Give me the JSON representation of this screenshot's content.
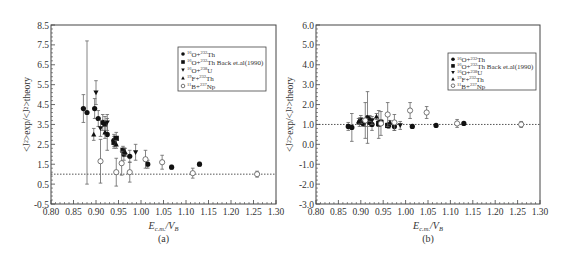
{
  "chart_data": [
    {
      "type": "scatter",
      "panel_label": "(a)",
      "xlabel": "E_c.m./V_B",
      "ylabel": "<J²>exp/<J²>theory",
      "xlim": [
        0.8,
        1.3
      ],
      "ylim": [
        -0.5,
        8.5
      ],
      "xticks": [
        "0.80",
        "0.85",
        "0.90",
        "0.95",
        "1.00",
        "1.05",
        "1.10",
        "1.15",
        "1.20",
        "1.25",
        "1.30"
      ],
      "yticks": [
        "-0.5",
        "0.5",
        "1.5",
        "2.5",
        "3.5",
        "4.5",
        "5.5",
        "6.5",
        "7.5",
        "8.5"
      ],
      "reference_line": 1.0,
      "legend_position": "upper right",
      "series": [
        {
          "name": "16O+232Th",
          "marker": "filled-circle",
          "x": [
            0.872,
            0.88,
            0.897,
            0.905,
            0.915,
            0.92,
            0.925,
            0.94,
            0.962,
            0.975,
            1.015,
            1.068,
            1.13
          ],
          "y": [
            4.3,
            4.1,
            4.3,
            3.8,
            3.6,
            3.5,
            3.0,
            2.7,
            2.0,
            1.9,
            1.5,
            1.35,
            1.5
          ],
          "err": [
            0.7,
            3.6,
            0.5,
            0.4,
            0.4,
            0.4,
            0.8,
            0.3,
            0.3,
            0.3,
            0.2,
            0.1,
            0.1
          ]
        },
        {
          "name": "16O+232Th Back et.al(1990)",
          "marker": "filled-square",
          "x": [
            0.94,
            0.945,
            0.96
          ],
          "y": [
            2.6,
            2.8,
            2.2
          ],
          "err": [
            0.3,
            0.3,
            0.2
          ]
        },
        {
          "name": "16O+238U",
          "marker": "filled-down-triangle",
          "x": [
            0.9,
            0.91,
            0.925,
            0.988
          ],
          "y": [
            5.1,
            3.3,
            3.6,
            2.1
          ],
          "err": [
            0.6,
            0.4,
            0.4,
            0.4
          ]
        },
        {
          "name": "19F+232Th",
          "marker": "filled-up-triangle",
          "x": [
            0.895,
            0.92,
            0.945,
            0.965
          ],
          "y": [
            3.0,
            3.1,
            2.5,
            2.1
          ],
          "err": [
            0.3,
            0.3,
            0.2,
            0.2
          ]
        },
        {
          "name": "11B+237Np",
          "marker": "open-circle",
          "x": [
            0.91,
            0.945,
            0.957,
            0.975,
            1.01,
            1.047,
            1.115,
            1.258
          ],
          "y": [
            1.65,
            1.1,
            1.55,
            1.1,
            1.75,
            1.6,
            1.05,
            1.0
          ],
          "err": [
            1.1,
            0.7,
            0.6,
            0.5,
            0.45,
            0.35,
            0.25,
            0.15
          ]
        }
      ]
    },
    {
      "type": "scatter",
      "panel_label": "(b)",
      "xlabel": "E_c.m./V_B",
      "ylabel": "<J²>exp/<J²>theory",
      "xlim": [
        0.8,
        1.3
      ],
      "ylim": [
        -3.0,
        6.0
      ],
      "xticks": [
        "0.80",
        "0.85",
        "0.90",
        "0.95",
        "1.00",
        "1.05",
        "1.10",
        "1.15",
        "1.20",
        "1.25",
        "1.30"
      ],
      "yticks": [
        "-3.0",
        "-2.0",
        "-1.0",
        "0.0",
        "1.0",
        "2.0",
        "3.0",
        "4.0",
        "5.0",
        "6.0"
      ],
      "reference_line": 1.0,
      "legend_position": "upper right",
      "series": [
        {
          "name": "16O+232Th",
          "marker": "filled-circle",
          "x": [
            0.872,
            0.88,
            0.897,
            0.905,
            0.915,
            0.92,
            0.925,
            0.94,
            0.962,
            0.975,
            1.015,
            1.068,
            1.13
          ],
          "y": [
            0.9,
            0.85,
            1.1,
            1.05,
            1.35,
            1.1,
            1.0,
            1.0,
            0.95,
            0.9,
            0.9,
            0.95,
            1.05
          ],
          "err": [
            0.2,
            0.7,
            0.2,
            0.15,
            1.3,
            0.2,
            0.3,
            0.7,
            0.15,
            0.2,
            0.1,
            0.05,
            0.05
          ]
        },
        {
          "name": "16O+232Th Back et.al(1990)",
          "marker": "filled-square",
          "x": [
            0.94,
            0.945,
            0.96
          ],
          "y": [
            1.05,
            1.1,
            0.95
          ],
          "err": [
            0.15,
            0.15,
            0.1
          ]
        },
        {
          "name": "16O+238U",
          "marker": "filled-down-triangle",
          "x": [
            0.9,
            0.91,
            0.925,
            0.988
          ],
          "y": [
            1.25,
            1.1,
            1.2,
            0.95
          ],
          "err": [
            0.2,
            0.2,
            0.2,
            0.2
          ]
        },
        {
          "name": "19F+232Th",
          "marker": "filled-up-triangle",
          "x": [
            0.895,
            0.92,
            0.935,
            0.965
          ],
          "y": [
            1.15,
            1.3,
            1.4,
            1.1
          ],
          "err": [
            0.15,
            0.15,
            0.15,
            0.1
          ]
        },
        {
          "name": "11B+237Np",
          "marker": "open-circle",
          "x": [
            0.91,
            0.945,
            0.96,
            0.975,
            1.01,
            1.047,
            1.115,
            1.258
          ],
          "y": [
            1.2,
            1.05,
            1.5,
            1.1,
            1.7,
            1.6,
            1.05,
            1.0
          ],
          "err": [
            0.9,
            0.6,
            0.6,
            0.4,
            0.4,
            0.3,
            0.2,
            0.15
          ]
        }
      ]
    }
  ],
  "panels": [
    {
      "label": "(a)",
      "xlabel_main": "E",
      "xlabel_sub": "c.m.",
      "xlabel_tail": "/V",
      "xlabel_tail_sub": "B"
    },
    {
      "label": "(b)",
      "xlabel_main": "E",
      "xlabel_sub": "c.m.",
      "xlabel_tail": "/V",
      "xlabel_tail_sub": "B"
    }
  ],
  "legend": {
    "entries": [
      {
        "pre": "16",
        "el": "O+",
        "pre2": "232",
        "el2": "Th",
        "suffix": ""
      },
      {
        "pre": "16",
        "el": "O+",
        "pre2": "232",
        "el2": "Th",
        "suffix": " Back et.al(1990)"
      },
      {
        "pre": "16",
        "el": "O+",
        "pre2": "238",
        "el2": "U",
        "suffix": ""
      },
      {
        "pre": "19",
        "el": "F+",
        "pre2": "232",
        "el2": "Th",
        "suffix": ""
      },
      {
        "pre": "11",
        "el": "B+",
        "pre2": "237",
        "el2": "Np",
        "suffix": ""
      }
    ]
  },
  "colors": {
    "axis": "#444444",
    "marker": "#111111",
    "refline": "#555555",
    "errorbar": "#666666"
  }
}
